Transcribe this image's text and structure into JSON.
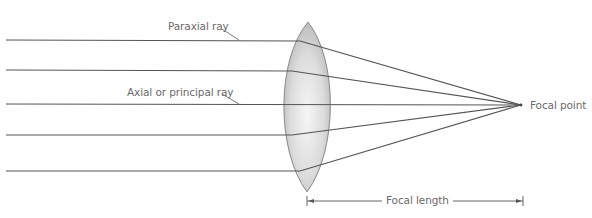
{
  "diagram": {
    "labels": {
      "paraxial_ray": "Paraxial ray",
      "axial_ray": "Axial or principal ray",
      "focal_point": "Focal point",
      "focal_length": "Focal length"
    },
    "colors": {
      "ray": "#555555",
      "lens_fill_edge": "#b8b8b8",
      "lens_fill_center": "#f4f4f4",
      "lens_outline": "#8a8a8a",
      "label_text": "#6a6a6a",
      "background": "#ffffff"
    },
    "geometry": {
      "focal_point": {
        "x": 521,
        "y": 105
      },
      "lens": {
        "top": {
          "x": 308,
          "y": 22
        },
        "bottom": {
          "x": 307,
          "y": 192
        },
        "left_x": 282,
        "right_x": 334
      },
      "rays": [
        {
          "name": "paraxial-ray-top",
          "y": 40,
          "bend_x": 300
        },
        {
          "name": "ray-upper",
          "y": 70,
          "bend_x": 292
        },
        {
          "name": "axial-ray",
          "y": 104,
          "bend_x": 521
        },
        {
          "name": "ray-lower",
          "y": 135,
          "bend_x": 292
        },
        {
          "name": "ray-bottom",
          "y": 171,
          "bend_x": 300
        }
      ],
      "focal_length_bar": {
        "x1": 307,
        "x2": 523,
        "y": 201
      }
    },
    "caption": {
      "visible": "partial (cut off at bottom edge, illegible)"
    }
  }
}
